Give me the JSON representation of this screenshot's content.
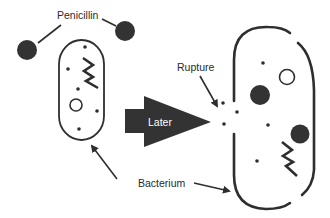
{
  "diagram": {
    "labels": {
      "penicillin": "Penicillin",
      "rupture": "Rupture",
      "later": "Later",
      "bacterium": "Bacterium"
    },
    "colors": {
      "ink": "#2e2e2e",
      "background": "#ffffff",
      "arrow_fill": "#333333",
      "arrow_text": "#ffffff"
    },
    "elements": [
      {
        "id": "penicillin-molecule-left",
        "shape": "filled-circle"
      },
      {
        "id": "penicillin-molecule-right",
        "shape": "filled-circle"
      },
      {
        "id": "intact-bacterium",
        "shape": "capsule-outline"
      },
      {
        "id": "time-arrow",
        "shape": "block-arrow",
        "label": "Later"
      },
      {
        "id": "ruptured-bacterium",
        "shape": "broken-capsule-outline"
      }
    ]
  }
}
